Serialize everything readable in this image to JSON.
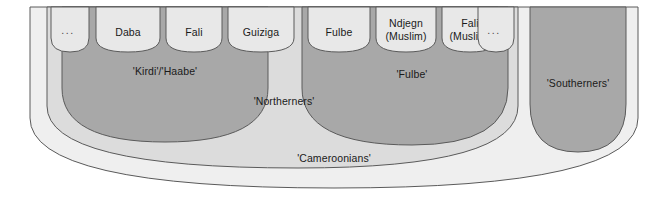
{
  "diagram": {
    "colors": {
      "outer_fill": "#efefef",
      "mid_fill": "#dcdcdc",
      "group_fill": "#a8a8a8",
      "cell_fill": "#e8e8e8",
      "stroke": "#5a5a5a",
      "text": "#1a1a1a",
      "background": "#ffffff"
    },
    "levels": [
      {
        "id": "cameroonians",
        "label": "'Cameroonians'",
        "depth": 0,
        "fill": "#efefef"
      },
      {
        "id": "northerners",
        "label": "'Northerners'",
        "depth": 1,
        "fill": "#dcdcdc"
      },
      {
        "id": "southerners",
        "label": "'Southerners'",
        "depth": 1,
        "fill": "#a8a8a8"
      },
      {
        "id": "kirdi-haabe",
        "label": "'Kirdi'/'Haabe'",
        "depth": 2,
        "fill": "#a8a8a8"
      },
      {
        "id": "fulbe",
        "label": "'Fulbe'",
        "depth": 2,
        "fill": "#a8a8a8"
      }
    ],
    "cells": {
      "kirdi_haabe": [
        {
          "id": "kirdi-ellipsis",
          "lines": [
            "..."
          ],
          "is_ellipsis": true
        },
        {
          "id": "daba",
          "lines": [
            "Daba"
          ],
          "is_ellipsis": false
        },
        {
          "id": "fali",
          "lines": [
            "Fali"
          ],
          "is_ellipsis": false
        },
        {
          "id": "guiziga",
          "lines": [
            "Guiziga"
          ],
          "is_ellipsis": false
        }
      ],
      "fulbe": [
        {
          "id": "fulbe-cell",
          "lines": [
            "Fulbe"
          ],
          "is_ellipsis": false
        },
        {
          "id": "ndjegn-muslim",
          "lines": [
            "Ndjegn",
            "(Muslim)"
          ],
          "is_ellipsis": false
        },
        {
          "id": "fali-muslim",
          "lines": [
            "Fali",
            "(Muslim)"
          ],
          "is_ellipsis": false
        },
        {
          "id": "fulbe-ellipsis",
          "lines": [
            "..."
          ],
          "is_ellipsis": true
        }
      ]
    },
    "labels": {
      "cameroonians": "'Cameroonians'",
      "northerners": "'Northerners'",
      "southerners": "'Southerners'",
      "kirdi_haabe": "'Kirdi'/'Haabe'",
      "fulbe": "'Fulbe'",
      "daba": "Daba",
      "fali": "Fali",
      "guiziga": "Guiziga",
      "fulbe_cell": "Fulbe",
      "ndjegn_line1": "Ndjegn",
      "ndjegn_line2": "(Muslim)",
      "fali_muslim_line1": "Fali",
      "fali_muslim_line2": "(Muslim)",
      "ellipsis_left": "...",
      "ellipsis_right": "..."
    }
  }
}
